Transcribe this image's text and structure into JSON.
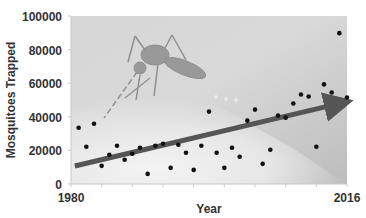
{
  "chart_data": {
    "type": "scatter",
    "title": "",
    "xlabel": "Year",
    "ylabel": "Mosquitoes Trapped",
    "xlim": [
      1980,
      2016
    ],
    "ylim": [
      0,
      100000
    ],
    "x_tick_labels": [
      "1980",
      "2016"
    ],
    "y_tick_labels": [
      "0",
      "20000",
      "40000",
      "60000",
      "80000",
      "100000"
    ],
    "y_ticks": [
      0,
      20000,
      40000,
      60000,
      80000,
      100000
    ],
    "grid": false,
    "legend": null,
    "background_image": "mosquito-photo",
    "series": [
      {
        "name": "Mosquitoes Trapped",
        "marker": "dot",
        "color": "#111111",
        "x": [
          1981,
          1982,
          1983,
          1984,
          1985,
          1986,
          1987,
          1988,
          1989,
          1990,
          1991,
          1992,
          1993,
          1994,
          1995,
          1996,
          1997,
          1998,
          1999,
          2000,
          2001,
          2002,
          2003,
          2004,
          2005,
          2006,
          2007,
          2008,
          2009,
          2010,
          2011,
          2012,
          2013,
          2014,
          2015,
          2016
        ],
        "values": [
          33500,
          22200,
          35900,
          10800,
          17400,
          22800,
          14400,
          18000,
          21600,
          6000,
          22800,
          24000,
          9600,
          23400,
          18600,
          8400,
          22800,
          43100,
          18600,
          9600,
          21600,
          16200,
          37700,
          44300,
          12000,
          20400,
          40700,
          39500,
          47900,
          53300,
          52100,
          22200,
          59300,
          54500,
          89800,
          51500
        ]
      }
    ],
    "annotations": [
      {
        "type": "trend-arrow",
        "color": "#555555",
        "from": {
          "x": 1980.5,
          "y": 10700
        },
        "to": {
          "x": 2016,
          "y": 49000
        }
      }
    ]
  }
}
